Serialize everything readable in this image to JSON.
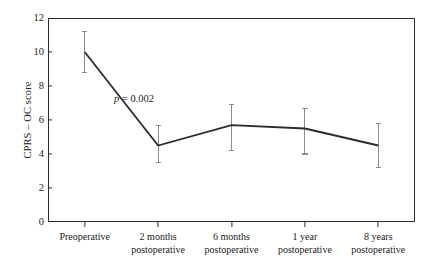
{
  "chart_data": {
    "type": "line",
    "title": "",
    "xlabel": "",
    "ylabel": "CPRS – OC score",
    "ylim": [
      0,
      12
    ],
    "yticks": [
      0,
      2,
      4,
      6,
      8,
      10,
      12
    ],
    "grid": false,
    "legend": null,
    "categories": [
      "Preoperative",
      "2 months postoperative",
      "6 months postoperative",
      "1 year postoperative",
      "8 years postoperative"
    ],
    "category_lines": [
      [
        "Preoperative",
        ""
      ],
      [
        "2 months",
        "postoperative"
      ],
      [
        "6 months",
        "postoperative"
      ],
      [
        "1 year",
        "postoperative"
      ],
      [
        "8 years",
        "postoperative"
      ]
    ],
    "series": [
      {
        "name": "CPRS – OC score (mean)",
        "values": [
          10.0,
          4.5,
          5.7,
          5.5,
          4.5
        ],
        "error_upper": [
          11.2,
          5.7,
          6.9,
          6.7,
          5.8
        ],
        "error_lower": [
          8.8,
          3.5,
          4.2,
          4.0,
          3.2
        ]
      }
    ],
    "annotations": [
      {
        "text_italic": "p",
        "text_rest": " = 0.002",
        "x_category": "2 months postoperative",
        "value": 7.6
      }
    ],
    "colors": {
      "line": "#2b2b2b",
      "error_bar": "#8c8c8c",
      "axis": "#2b2b2b",
      "background": "#ffffff",
      "text": "#1a1a1a"
    }
  }
}
